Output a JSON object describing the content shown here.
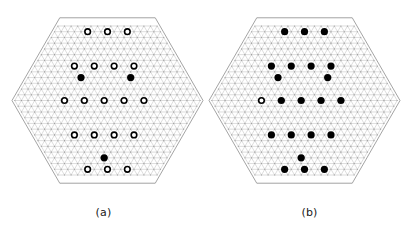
{
  "figure": {
    "kind": "two-panel-hexagonal-lattice-diagram",
    "width": 413,
    "height": 231,
    "background_color": "#ffffff"
  },
  "style": {
    "lattice_line_color": "#b4b4b4",
    "lattice_boundary_color": "#8c8c8c",
    "lattice_vertex_dot_color": "#999999",
    "marker_fill_color": "#000000",
    "marker_open_fill_color": "#ffffff",
    "marker_stroke_color": "#000000",
    "caption_color": "#1a1a1a",
    "lattice_line_width": 0.45,
    "lattice_boundary_width": 0.8,
    "marker_radius": 3.6,
    "marker_stroke_width": 1.6,
    "vertex_dot_radius": 0.55
  },
  "lattice": {
    "type": "triangular",
    "hex_radius_rings": 13,
    "spacing_px": 6.62,
    "note": "points on a triangular lattice clipped to a regular hexagon with flat left/right vertices"
  },
  "panels": [
    {
      "id": "a",
      "caption": "(a)",
      "center": {
        "x": 107.5,
        "y": 100.5
      },
      "hex_radius": 95.5,
      "orientation": "pointy-left-right",
      "markers": [
        {
          "u": -6,
          "v": 12,
          "style": "open"
        },
        {
          "u": 0,
          "v": 12,
          "style": "open"
        },
        {
          "u": 6,
          "v": 12,
          "style": "open"
        },
        {
          "u": -10,
          "v": 6,
          "style": "open"
        },
        {
          "u": -4,
          "v": 6,
          "style": "open"
        },
        {
          "u": 2,
          "v": 6,
          "style": "open"
        },
        {
          "u": 8,
          "v": 6,
          "style": "open"
        },
        {
          "u": -8,
          "v": 4,
          "style": "filled"
        },
        {
          "u": 7,
          "v": 4,
          "style": "filled"
        },
        {
          "u": -13,
          "v": 0,
          "style": "open"
        },
        {
          "u": -7,
          "v": 0,
          "style": "open"
        },
        {
          "u": -1,
          "v": 0,
          "style": "open"
        },
        {
          "u": 5,
          "v": 0,
          "style": "open"
        },
        {
          "u": 11,
          "v": 0,
          "style": "open"
        },
        {
          "u": -10,
          "v": -6,
          "style": "open"
        },
        {
          "u": -4,
          "v": -6,
          "style": "open"
        },
        {
          "u": 2,
          "v": -6,
          "style": "open"
        },
        {
          "u": 8,
          "v": -6,
          "style": "open"
        },
        {
          "u": -1,
          "v": -10,
          "style": "filled"
        },
        {
          "u": -6,
          "v": -12,
          "style": "open"
        },
        {
          "u": 0,
          "v": -12,
          "style": "open"
        },
        {
          "u": 6,
          "v": -12,
          "style": "open"
        }
      ]
    },
    {
      "id": "b",
      "caption": "(b)",
      "center": {
        "x": 304.5,
        "y": 100.5
      },
      "hex_radius": 95.5,
      "orientation": "pointy-left-right",
      "markers": [
        {
          "u": -6,
          "v": 12,
          "style": "filled"
        },
        {
          "u": 0,
          "v": 12,
          "style": "filled"
        },
        {
          "u": 6,
          "v": 12,
          "style": "filled"
        },
        {
          "u": -10,
          "v": 6,
          "style": "filled"
        },
        {
          "u": -4,
          "v": 6,
          "style": "filled"
        },
        {
          "u": 2,
          "v": 6,
          "style": "filled"
        },
        {
          "u": 8,
          "v": 6,
          "style": "filled"
        },
        {
          "u": -8,
          "v": 4,
          "style": "filled"
        },
        {
          "u": 7,
          "v": 4,
          "style": "filled"
        },
        {
          "u": -13,
          "v": 0,
          "style": "open"
        },
        {
          "u": -7,
          "v": 0,
          "style": "filled"
        },
        {
          "u": -1,
          "v": 0,
          "style": "filled"
        },
        {
          "u": 5,
          "v": 0,
          "style": "filled"
        },
        {
          "u": 11,
          "v": 0,
          "style": "filled"
        },
        {
          "u": -10,
          "v": -6,
          "style": "filled"
        },
        {
          "u": -4,
          "v": -6,
          "style": "filled"
        },
        {
          "u": 2,
          "v": -6,
          "style": "filled"
        },
        {
          "u": 8,
          "v": -6,
          "style": "filled"
        },
        {
          "u": -1,
          "v": -10,
          "style": "filled"
        },
        {
          "u": -6,
          "v": -12,
          "style": "filled"
        },
        {
          "u": 0,
          "v": -12,
          "style": "filled"
        },
        {
          "u": 6,
          "v": -12,
          "style": "filled"
        }
      ]
    }
  ]
}
